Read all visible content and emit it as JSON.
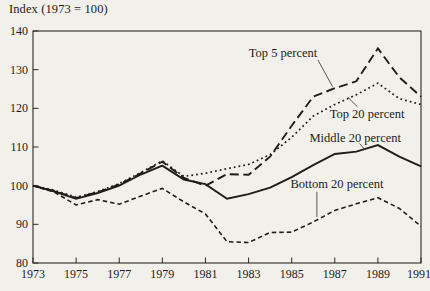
{
  "page": {
    "background": "#f2f0ea",
    "ink": "#1d1d1b"
  },
  "chart_data": {
    "type": "line",
    "title": "Index (1973 = 100)",
    "xlabel": "",
    "ylabel": "Index (1973 = 100)",
    "grid": false,
    "legend_position": "inline-annotations",
    "xlim": [
      1973,
      1991
    ],
    "ylim": [
      80,
      140
    ],
    "x": [
      1973,
      1974,
      1975,
      1976,
      1977,
      1978,
      1979,
      1980,
      1981,
      1982,
      1983,
      1984,
      1985,
      1986,
      1987,
      1988,
      1989,
      1990,
      1991
    ],
    "x_tick_labels": [
      "1973",
      "1975",
      "1977",
      "1979",
      "1981",
      "1983",
      "1985",
      "1987",
      "1989",
      "1991"
    ],
    "y_tick_labels": [
      "80",
      "90",
      "100",
      "110",
      "120",
      "130",
      "140"
    ],
    "series": [
      {
        "name": "Bottom 20 percent",
        "line_style": "short-dash",
        "values": [
          100,
          98.3,
          95.0,
          96.4,
          95.2,
          97.3,
          99.3,
          95.8,
          92.7,
          85.5,
          85.3,
          87.9,
          88.0,
          90.6,
          93.6,
          95.3,
          96.9,
          94.1,
          89.5
        ]
      },
      {
        "name": "Middle 20 percent",
        "line_style": "solid",
        "values": [
          100,
          98.5,
          96.6,
          98.1,
          100.0,
          102.9,
          105.2,
          101.6,
          100.4,
          96.6,
          97.8,
          99.5,
          102.2,
          105.3,
          108.2,
          108.8,
          110.5,
          107.5,
          105.0
        ]
      },
      {
        "name": "Top 20 percent",
        "line_style": "dotted",
        "values": [
          100,
          98.8,
          97.0,
          98.5,
          100.5,
          103.4,
          106.4,
          102.4,
          103.2,
          104.4,
          105.5,
          108.0,
          112.5,
          118.0,
          121.0,
          123.5,
          126.5,
          122.5,
          121.0
        ]
      },
      {
        "name": "Top 5 percent",
        "line_style": "long-dash",
        "values": [
          100,
          98.6,
          96.8,
          98.3,
          100.3,
          103.2,
          106.2,
          102.0,
          100.0,
          103.0,
          102.8,
          107.5,
          115.5,
          123.0,
          125.2,
          127.0,
          135.5,
          128.0,
          123.0
        ]
      }
    ],
    "annotations": [
      {
        "text": "Top 5 percent",
        "x": 1984.6,
        "y": 134.3,
        "leader": [
          [
            1986.22,
            132.5
          ],
          [
            1986.9,
            125.6
          ]
        ]
      },
      {
        "text": "Top 20 percent",
        "x": 1988.5,
        "y": 118.5,
        "leader": [
          [
            1988.05,
            120.4
          ],
          [
            1987.6,
            122.9
          ]
        ]
      },
      {
        "text": "Middle 20 percent",
        "x": 1987.95,
        "y": 112.4,
        "leader": [
          [
            1988.15,
            110.9
          ],
          [
            1988.4,
            109.3
          ]
        ]
      },
      {
        "text": "Bottom 20 percent",
        "x": 1987.1,
        "y": 100.4,
        "leader": [
          [
            1986.17,
            98.4
          ],
          [
            1986.17,
            91.9
          ]
        ]
      }
    ]
  }
}
